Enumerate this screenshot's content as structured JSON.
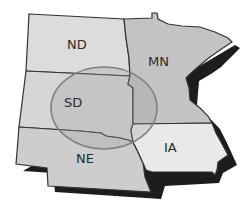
{
  "map": {
    "states": [
      {
        "id": "ND",
        "label": "ND",
        "fill": "#dcdcdc"
      },
      {
        "id": "SD",
        "label": "SD",
        "fill": "#d6d6d6"
      },
      {
        "id": "NE",
        "label": "NE",
        "fill": "#cdcdcd"
      },
      {
        "id": "MN",
        "label": "MN",
        "fill": "#c3c3c3"
      },
      {
        "id": "IA",
        "label": "IA",
        "fill": "#e9e9e9"
      }
    ],
    "highlight_region": {
      "shape": "ellipse",
      "fill": "#9a9a9a",
      "stroke": "#808080"
    },
    "colors": {
      "border": "#333333",
      "shadow": "#111111",
      "background": "#ffffff"
    }
  }
}
